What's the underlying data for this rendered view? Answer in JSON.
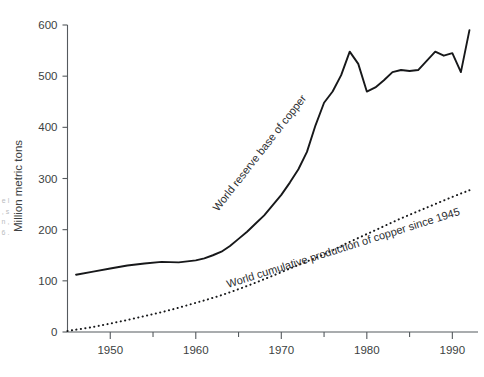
{
  "figure": {
    "background_color": "#ffffff",
    "axis_color": "#555a5e",
    "line_color": "#17181a",
    "text_color": "#3c3f42"
  },
  "edge_fragment": {
    "text": "e l , s n , 6 ."
  },
  "chart_data": {
    "type": "line",
    "title": "",
    "subtitle": "",
    "xlabel": "",
    "ylabel": "Million metric tons",
    "xlim": [
      1945,
      1993
    ],
    "ylim": [
      0,
      620
    ],
    "grid": false,
    "legend_position": "inline-labels",
    "x_ticks_major": [
      1950,
      1960,
      1970,
      1980,
      1990
    ],
    "x_ticks_minor": [
      1955,
      1965,
      1975,
      1985
    ],
    "x_tick_labels": [
      "1950",
      "1960",
      "1970",
      "1980",
      "1990"
    ],
    "y_ticks": [
      0,
      100,
      200,
      300,
      400,
      500,
      600
    ],
    "y_tick_labels": [
      "0",
      "100",
      "200",
      "300",
      "400",
      "500",
      "600"
    ],
    "series": [
      {
        "name": "World reserve base of copper",
        "style": "solid",
        "label_text": "World reserve base of copper",
        "x": [
          1946,
          1948,
          1950,
          1952,
          1954,
          1956,
          1958,
          1960,
          1961,
          1962,
          1963,
          1964,
          1965,
          1966,
          1967,
          1968,
          1969,
          1970,
          1971,
          1972,
          1973,
          1974,
          1975,
          1976,
          1977,
          1978,
          1979,
          1980,
          1981,
          1982,
          1983,
          1984,
          1985,
          1986,
          1987,
          1988,
          1989,
          1990,
          1991,
          1992
        ],
        "values": [
          112,
          118,
          124,
          130,
          134,
          137,
          136,
          140,
          144,
          150,
          157,
          168,
          182,
          196,
          212,
          228,
          248,
          268,
          292,
          318,
          352,
          404,
          448,
          470,
          502,
          548,
          524,
          470,
          478,
          492,
          508,
          512,
          510,
          512,
          530,
          548,
          540,
          545,
          508,
          590
        ]
      },
      {
        "name": "World cumulative production of copper since 1945",
        "style": "dotted",
        "label_text": "World cumulative production of copper since 1945",
        "x": [
          1945,
          1948,
          1951,
          1954,
          1957,
          1960,
          1963,
          1966,
          1969,
          1972,
          1975,
          1978,
          1981,
          1984,
          1987,
          1990,
          1992
        ],
        "values": [
          2,
          10,
          20,
          31,
          43,
          57,
          72,
          90,
          110,
          131,
          152,
          176,
          199,
          222,
          243,
          264,
          277
        ]
      }
    ]
  }
}
